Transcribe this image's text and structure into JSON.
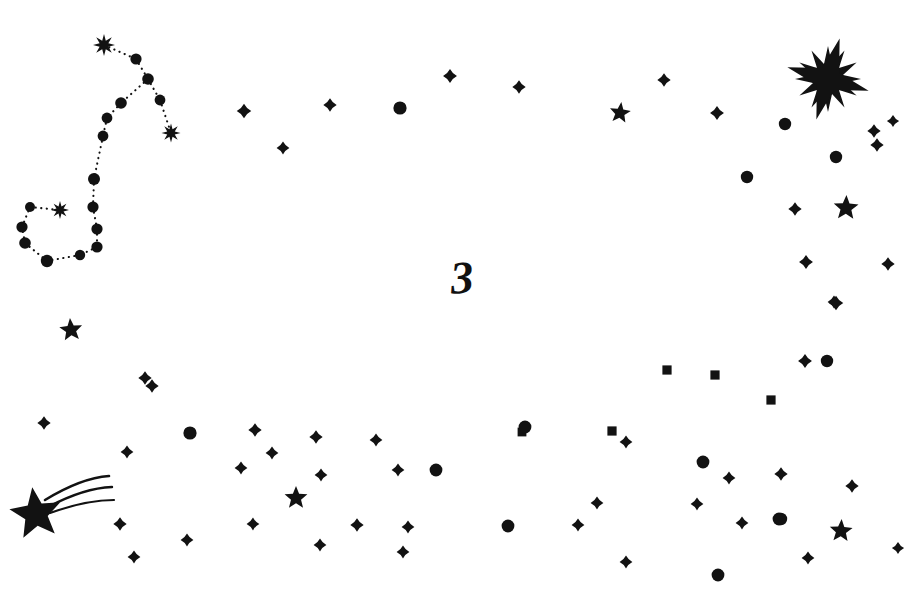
{
  "page": {
    "number_label": "3",
    "background_color": "#ffffff",
    "ink_color": "#121212",
    "width": 911,
    "height": 605
  },
  "constellation": {
    "name": "scorpius-constellation",
    "line_style": "dotted",
    "line_color": "#121212",
    "nodes": [
      {
        "name": "node-burst-top",
        "x": 104,
        "y": 45,
        "type": "burst",
        "size": 11
      },
      {
        "name": "node-2",
        "x": 136,
        "y": 59,
        "type": "dot",
        "size": 5.6
      },
      {
        "name": "node-3",
        "x": 148,
        "y": 79,
        "type": "dot",
        "size": 5.8
      },
      {
        "name": "node-4",
        "x": 160,
        "y": 100,
        "type": "dot",
        "size": 5.4
      },
      {
        "name": "node-burst-right",
        "x": 171,
        "y": 133,
        "type": "burst",
        "size": 9.5
      },
      {
        "name": "node-5",
        "x": 121,
        "y": 103,
        "type": "dot",
        "size": 5.8
      },
      {
        "name": "node-6",
        "x": 107,
        "y": 118,
        "type": "dot",
        "size": 5.4
      },
      {
        "name": "node-7",
        "x": 103,
        "y": 136,
        "type": "dot",
        "size": 5.4
      },
      {
        "name": "node-8",
        "x": 94,
        "y": 179,
        "type": "dot",
        "size": 6.0
      },
      {
        "name": "node-9",
        "x": 93,
        "y": 207,
        "type": "dot",
        "size": 5.6
      },
      {
        "name": "node-10",
        "x": 97,
        "y": 229,
        "type": "dot",
        "size": 5.6
      },
      {
        "name": "node-11",
        "x": 97,
        "y": 247,
        "type": "dot",
        "size": 5.6
      },
      {
        "name": "node-12",
        "x": 80,
        "y": 255,
        "type": "dot",
        "size": 5.2
      },
      {
        "name": "node-13",
        "x": 47,
        "y": 261,
        "type": "dot",
        "size": 6.2
      },
      {
        "name": "node-14",
        "x": 25,
        "y": 243,
        "type": "dot",
        "size": 5.8
      },
      {
        "name": "node-15",
        "x": 22,
        "y": 227,
        "type": "dot",
        "size": 5.6
      },
      {
        "name": "node-16",
        "x": 30,
        "y": 207,
        "type": "dot",
        "size": 5.0
      },
      {
        "name": "node-burst-left",
        "x": 60,
        "y": 210,
        "type": "burst",
        "size": 9.0
      }
    ],
    "edges": [
      [
        0,
        1
      ],
      [
        1,
        2
      ],
      [
        2,
        3
      ],
      [
        3,
        4
      ],
      [
        2,
        5
      ],
      [
        5,
        6
      ],
      [
        6,
        7
      ],
      [
        7,
        8
      ],
      [
        8,
        9
      ],
      [
        9,
        10
      ],
      [
        10,
        11
      ],
      [
        11,
        12
      ],
      [
        12,
        13
      ],
      [
        13,
        14
      ],
      [
        14,
        15
      ],
      [
        15,
        16
      ],
      [
        16,
        17
      ]
    ]
  },
  "shooting_star": {
    "name": "shooting-star",
    "x": 36,
    "y": 514,
    "size": 27,
    "trail_count": 3
  },
  "big_star": {
    "name": "big-burst-star",
    "x": 828,
    "y": 79,
    "size": 33,
    "points": 12
  },
  "stars": [
    {
      "type": "diamond",
      "x": 244,
      "y": 111,
      "size": 5.0
    },
    {
      "type": "diamond",
      "x": 330,
      "y": 105,
      "size": 4.6
    },
    {
      "type": "diamond",
      "x": 283,
      "y": 148,
      "size": 4.4
    },
    {
      "type": "circle",
      "x": 400,
      "y": 108,
      "size": 6.6
    },
    {
      "type": "diamond",
      "x": 450,
      "y": 76,
      "size": 4.8
    },
    {
      "type": "diamond",
      "x": 519,
      "y": 87,
      "size": 4.6
    },
    {
      "type": "diamond",
      "x": 664,
      "y": 80,
      "size": 4.6
    },
    {
      "type": "star5",
      "x": 620,
      "y": 113,
      "size": 11
    },
    {
      "type": "diamond",
      "x": 717,
      "y": 113,
      "size": 4.8
    },
    {
      "type": "circle",
      "x": 785,
      "y": 124,
      "size": 6.2
    },
    {
      "type": "diamond",
      "x": 874,
      "y": 131,
      "size": 4.6
    },
    {
      "type": "diamond",
      "x": 877,
      "y": 145,
      "size": 4.6
    },
    {
      "type": "circle",
      "x": 836,
      "y": 157,
      "size": 6.2
    },
    {
      "type": "circle",
      "x": 747,
      "y": 177,
      "size": 6.2
    },
    {
      "type": "star5",
      "x": 846,
      "y": 208,
      "size": 13
    },
    {
      "type": "diamond",
      "x": 795,
      "y": 209,
      "size": 4.6
    },
    {
      "type": "diamond",
      "x": 806,
      "y": 262,
      "size": 4.8
    },
    {
      "type": "diamond",
      "x": 888,
      "y": 264,
      "size": 4.6
    },
    {
      "type": "diamond",
      "x": 836,
      "y": 303,
      "size": 5.0
    },
    {
      "type": "star5",
      "x": 71,
      "y": 330,
      "size": 12
    },
    {
      "type": "diamond",
      "x": 145,
      "y": 378,
      "size": 4.6
    },
    {
      "type": "diamond",
      "x": 152,
      "y": 386,
      "size": 4.6
    },
    {
      "type": "square",
      "x": 667,
      "y": 370,
      "size": 4.6
    },
    {
      "type": "square",
      "x": 715,
      "y": 375,
      "size": 4.6
    },
    {
      "type": "square",
      "x": 771,
      "y": 400,
      "size": 4.6
    },
    {
      "type": "diamond",
      "x": 805,
      "y": 361,
      "size": 4.8
    },
    {
      "type": "circle",
      "x": 827,
      "y": 361,
      "size": 6.2
    },
    {
      "type": "diamond",
      "x": 834,
      "y": 302,
      "size": 4.4
    },
    {
      "type": "diamond",
      "x": 44,
      "y": 423,
      "size": 4.6
    },
    {
      "type": "diamond",
      "x": 127,
      "y": 452,
      "size": 4.4
    },
    {
      "type": "circle",
      "x": 190,
      "y": 433,
      "size": 6.6
    },
    {
      "type": "diamond",
      "x": 241,
      "y": 468,
      "size": 4.4
    },
    {
      "type": "diamond",
      "x": 255,
      "y": 430,
      "size": 4.6
    },
    {
      "type": "diamond",
      "x": 272,
      "y": 453,
      "size": 4.4
    },
    {
      "type": "diamond",
      "x": 316,
      "y": 437,
      "size": 4.6
    },
    {
      "type": "diamond",
      "x": 321,
      "y": 475,
      "size": 4.4
    },
    {
      "type": "star5",
      "x": 296,
      "y": 498,
      "size": 12
    },
    {
      "type": "diamond",
      "x": 376,
      "y": 440,
      "size": 4.4
    },
    {
      "type": "diamond",
      "x": 398,
      "y": 470,
      "size": 4.4
    },
    {
      "type": "circle",
      "x": 436,
      "y": 470,
      "size": 6.4
    },
    {
      "type": "square",
      "x": 522,
      "y": 432,
      "size": 4.4
    },
    {
      "type": "circle",
      "x": 525,
      "y": 427,
      "size": 6.4
    },
    {
      "type": "square",
      "x": 612,
      "y": 431,
      "size": 4.6
    },
    {
      "type": "diamond",
      "x": 626,
      "y": 442,
      "size": 4.4
    },
    {
      "type": "circle",
      "x": 703,
      "y": 462,
      "size": 6.4
    },
    {
      "type": "diamond",
      "x": 597,
      "y": 503,
      "size": 4.4
    },
    {
      "type": "diamond",
      "x": 697,
      "y": 504,
      "size": 4.4
    },
    {
      "type": "diamond",
      "x": 729,
      "y": 478,
      "size": 4.4
    },
    {
      "type": "diamond",
      "x": 781,
      "y": 474,
      "size": 4.6
    },
    {
      "type": "circle",
      "x": 779,
      "y": 519,
      "size": 6.4
    },
    {
      "type": "circle",
      "x": 781,
      "y": 519,
      "size": 6.2
    },
    {
      "type": "star5",
      "x": 841,
      "y": 531,
      "size": 12
    },
    {
      "type": "diamond",
      "x": 852,
      "y": 486,
      "size": 4.6
    },
    {
      "type": "diamond",
      "x": 120,
      "y": 524,
      "size": 4.6
    },
    {
      "type": "diamond",
      "x": 134,
      "y": 557,
      "size": 4.4
    },
    {
      "type": "diamond",
      "x": 187,
      "y": 540,
      "size": 4.4
    },
    {
      "type": "diamond",
      "x": 253,
      "y": 524,
      "size": 4.4
    },
    {
      "type": "diamond",
      "x": 320,
      "y": 545,
      "size": 4.4
    },
    {
      "type": "diamond",
      "x": 357,
      "y": 525,
      "size": 4.6
    },
    {
      "type": "diamond",
      "x": 403,
      "y": 552,
      "size": 4.4
    },
    {
      "type": "diamond",
      "x": 408,
      "y": 527,
      "size": 4.4
    },
    {
      "type": "circle",
      "x": 508,
      "y": 526,
      "size": 6.4
    },
    {
      "type": "diamond",
      "x": 578,
      "y": 525,
      "size": 4.4
    },
    {
      "type": "diamond",
      "x": 626,
      "y": 562,
      "size": 4.4
    },
    {
      "type": "circle",
      "x": 718,
      "y": 575,
      "size": 6.4
    },
    {
      "type": "diamond",
      "x": 742,
      "y": 523,
      "size": 4.4
    },
    {
      "type": "diamond",
      "x": 808,
      "y": 558,
      "size": 4.4
    },
    {
      "type": "diamond",
      "x": 893,
      "y": 121,
      "size": 4.2
    },
    {
      "type": "diamond",
      "x": 898,
      "y": 548,
      "size": 4.2
    }
  ]
}
